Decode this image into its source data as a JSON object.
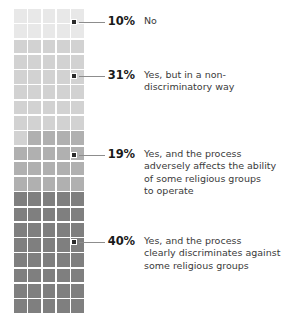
{
  "chart_data": {
    "type": "pie",
    "subtype": "waffle-grid",
    "title": "",
    "subtitle": "",
    "xlabel": "",
    "ylabel": "",
    "grid": {
      "columns": 5,
      "rows": 20,
      "total_cells": 100,
      "fill_order": "top-to-bottom rows"
    },
    "legend_position": "right",
    "unit": "%",
    "categories": [
      "No",
      "Yes, but in a non-discriminatory way",
      "Yes, and the process adversely affects the ability of some religious groups to operate",
      "Yes, and the process clearly discriminates against some religious groups"
    ],
    "values": [
      10,
      31,
      19,
      40
    ],
    "colors": [
      "#e8e8e8",
      "#d2d2d2",
      "#b0b0b0",
      "#7f7f7f"
    ],
    "segments": [
      {
        "percent_label": "10%",
        "value": 10,
        "label": "No",
        "color": "#e8e8e8",
        "cell_start": 0,
        "cell_end": 10
      },
      {
        "percent_label": "31%",
        "value": 31,
        "label": "Yes, but in a non-\ndiscriminatory way",
        "color": "#d2d2d2",
        "cell_start": 10,
        "cell_end": 41
      },
      {
        "percent_label": "19%",
        "value": 19,
        "label": "Yes, and the process\nadversely affects the ability\nof some religious groups\nto operate",
        "color": "#b0b0b0",
        "cell_start": 41,
        "cell_end": 60
      },
      {
        "percent_label": "40%",
        "value": 40,
        "label": "Yes, and the process\nclearly discriminates against\nsome religious groups",
        "color": "#7f7f7f",
        "cell_start": 60,
        "cell_end": 100
      }
    ],
    "markers": [
      {
        "name": "marker-10",
        "cell_index": 4,
        "x": 73,
        "y": 21
      },
      {
        "name": "marker-31",
        "cell_index": 24,
        "x": 73,
        "y": 75
      },
      {
        "name": "marker-19",
        "cell_index": 49,
        "x": 73,
        "y": 154
      },
      {
        "name": "marker-40",
        "cell_index": 79,
        "x": 73,
        "y": 241
      }
    ],
    "line_color": "#8d8d8d",
    "marker_color": "#2b2b2b",
    "background": "#ffffff"
  }
}
